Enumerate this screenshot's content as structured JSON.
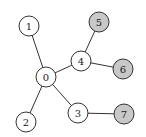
{
  "diagram": {
    "type": "tree-graph",
    "colors": {
      "default_fill": "#ffffff",
      "highlight_fill": "#c8c8c8",
      "stroke": "#333333"
    },
    "nodes": [
      {
        "id": "0",
        "label": "0",
        "x": 46,
        "y": 77,
        "highlighted": false
      },
      {
        "id": "1",
        "label": "1",
        "x": 29,
        "y": 26,
        "highlighted": false
      },
      {
        "id": "2",
        "label": "2",
        "x": 26,
        "y": 122,
        "highlighted": false
      },
      {
        "id": "3",
        "label": "3",
        "x": 78,
        "y": 113,
        "highlighted": false
      },
      {
        "id": "4",
        "label": "4",
        "x": 81,
        "y": 61,
        "highlighted": false
      },
      {
        "id": "5",
        "label": "5",
        "x": 99,
        "y": 22,
        "highlighted": true
      },
      {
        "id": "6",
        "label": "6",
        "x": 123,
        "y": 69,
        "highlighted": true
      },
      {
        "id": "7",
        "label": "7",
        "x": 124,
        "y": 114,
        "highlighted": true
      }
    ],
    "edges": [
      {
        "from": "0",
        "to": "1"
      },
      {
        "from": "0",
        "to": "2"
      },
      {
        "from": "0",
        "to": "3"
      },
      {
        "from": "0",
        "to": "4"
      },
      {
        "from": "4",
        "to": "5"
      },
      {
        "from": "4",
        "to": "6"
      },
      {
        "from": "3",
        "to": "7"
      }
    ]
  }
}
